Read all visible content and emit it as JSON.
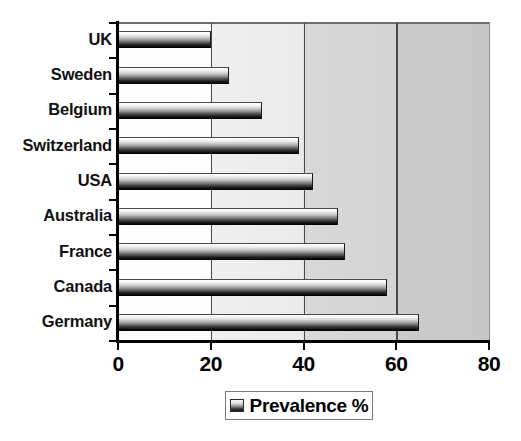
{
  "chart_data": {
    "type": "bar",
    "orientation": "horizontal",
    "title": "",
    "xlabel": "",
    "ylabel": "",
    "categories": [
      "UK",
      "Sweden",
      "Belgium",
      "Switzerland",
      "USA",
      "Australia",
      "France",
      "Canada",
      "Germany"
    ],
    "series": [
      {
        "name": "Prevalence %",
        "values": [
          20,
          24,
          31,
          39,
          42,
          47.5,
          49,
          58,
          65
        ]
      }
    ],
    "values": [
      20,
      24,
      31,
      39,
      42,
      47.5,
      49,
      58,
      65
    ],
    "xlim": [
      0,
      80
    ],
    "xticks": [
      0,
      20,
      40,
      60,
      80
    ],
    "xtick_labels": [
      "0",
      "20",
      "40",
      "60",
      "80"
    ],
    "grid": "vertical-major",
    "legend": {
      "position": "bottom-center",
      "entries": [
        {
          "label": "Prevalence %",
          "swatch": "gradient-grey-bar"
        }
      ]
    },
    "plot_background": "light-to-dark-grey-gradient",
    "bar_fill": "vertical-gradient-white-to-black"
  },
  "colors": {
    "axis": "#000000",
    "gridline": "#4a4a4a",
    "frame": "#7a7a7a",
    "bar_light": "#ffffff",
    "bar_dark": "#0a0a0a",
    "text": "#000000",
    "plot_bg_left": "#ffffff",
    "plot_bg_right": "#c6c6c6"
  },
  "legend": {
    "label": "Prevalence %"
  }
}
